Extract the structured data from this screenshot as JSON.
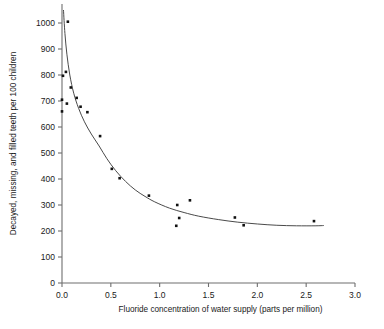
{
  "chart_data": {
    "type": "scatter",
    "title": "",
    "xlabel": "Fluoride concentration of water supply (parts per million)",
    "ylabel": "Decayed, missing, and filled teeth per 100 children",
    "xlim": [
      0.0,
      3.0
    ],
    "ylim": [
      0,
      1050
    ],
    "xticks": [
      "0.0",
      "0.5",
      "1.0",
      "1.5",
      "2.0",
      "2.5",
      "3.0"
    ],
    "xtick_values": [
      0.0,
      0.5,
      1.0,
      1.5,
      2.0,
      2.5,
      3.0
    ],
    "yticks": [
      "0",
      "100",
      "200",
      "300",
      "400",
      "500",
      "600",
      "700",
      "800",
      "900",
      "1000"
    ],
    "ytick_values": [
      0,
      100,
      200,
      300,
      400,
      500,
      600,
      700,
      800,
      900,
      1000
    ],
    "grid": false,
    "legend": "none",
    "series": [
      {
        "name": "Observed communities",
        "marker": "filled-square",
        "color": "#111111",
        "points": [
          {
            "x": 0.0,
            "y": 660
          },
          {
            "x": 0.0,
            "y": 705
          },
          {
            "x": 0.01,
            "y": 797
          },
          {
            "x": 0.04,
            "y": 812
          },
          {
            "x": 0.05,
            "y": 690
          },
          {
            "x": 0.06,
            "y": 1005
          },
          {
            "x": 0.09,
            "y": 752
          },
          {
            "x": 0.15,
            "y": 712
          },
          {
            "x": 0.19,
            "y": 678
          },
          {
            "x": 0.26,
            "y": 657
          },
          {
            "x": 0.39,
            "y": 565
          },
          {
            "x": 0.51,
            "y": 439
          },
          {
            "x": 0.59,
            "y": 403
          },
          {
            "x": 0.89,
            "y": 336
          },
          {
            "x": 1.17,
            "y": 220
          },
          {
            "x": 1.18,
            "y": 300
          },
          {
            "x": 1.2,
            "y": 250
          },
          {
            "x": 1.31,
            "y": 318
          },
          {
            "x": 1.77,
            "y": 252
          },
          {
            "x": 1.86,
            "y": 222
          },
          {
            "x": 2.58,
            "y": 238
          }
        ]
      }
    ],
    "fit_curve": {
      "name": "fitted decay curve",
      "color": "#4a4a4a",
      "points": [
        {
          "x": 0.015,
          "y": 1050
        },
        {
          "x": 0.03,
          "y": 960
        },
        {
          "x": 0.05,
          "y": 880
        },
        {
          "x": 0.08,
          "y": 800
        },
        {
          "x": 0.12,
          "y": 730
        },
        {
          "x": 0.17,
          "y": 672
        },
        {
          "x": 0.23,
          "y": 620
        },
        {
          "x": 0.3,
          "y": 573
        },
        {
          "x": 0.38,
          "y": 527
        },
        {
          "x": 0.46,
          "y": 478
        },
        {
          "x": 0.55,
          "y": 432
        },
        {
          "x": 0.65,
          "y": 391
        },
        {
          "x": 0.75,
          "y": 358
        },
        {
          "x": 0.85,
          "y": 333
        },
        {
          "x": 0.95,
          "y": 312
        },
        {
          "x": 1.1,
          "y": 288
        },
        {
          "x": 1.25,
          "y": 271
        },
        {
          "x": 1.4,
          "y": 257
        },
        {
          "x": 1.6,
          "y": 244
        },
        {
          "x": 1.8,
          "y": 234
        },
        {
          "x": 2.0,
          "y": 227
        },
        {
          "x": 2.2,
          "y": 222
        },
        {
          "x": 2.4,
          "y": 220
        },
        {
          "x": 2.6,
          "y": 220
        },
        {
          "x": 2.68,
          "y": 221
        }
      ]
    }
  }
}
